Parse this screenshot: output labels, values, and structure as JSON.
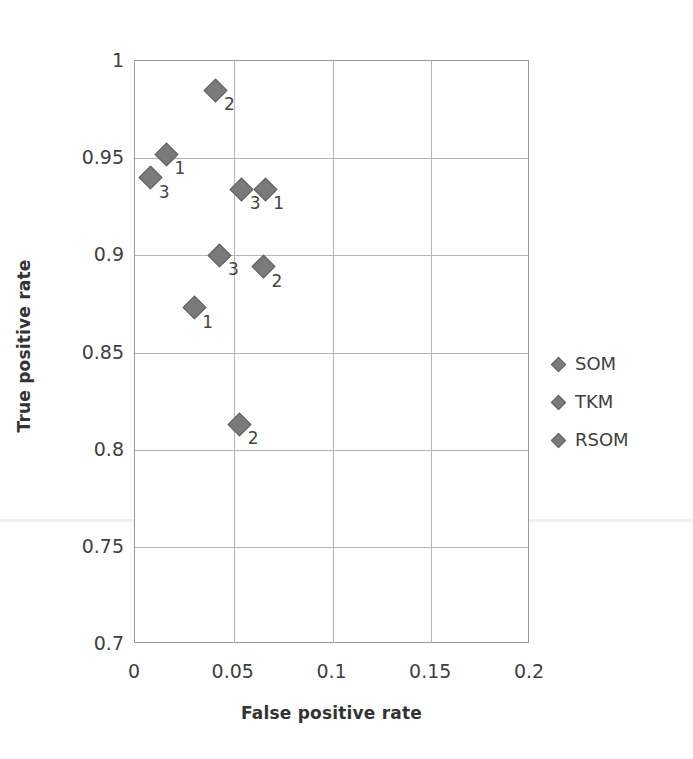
{
  "chart_data": {
    "type": "scatter",
    "title": "",
    "xlabel": "False positive rate",
    "ylabel": "True positive rate",
    "xlim": [
      0,
      0.2
    ],
    "ylim": [
      0.7,
      1
    ],
    "xticks": [
      "0",
      "0.05",
      "0.1",
      "0.15",
      "0.2"
    ],
    "xtick_values": [
      0,
      0.05,
      0.1,
      0.15,
      0.2
    ],
    "yticks": [
      "1",
      "0.95",
      "0.9",
      "0.85",
      "0.8",
      "0.75",
      "0.7"
    ],
    "ytick_values": [
      1,
      0.95,
      0.9,
      0.85,
      0.8,
      0.75,
      0.7
    ],
    "grid": true,
    "legend_position": "right",
    "marker_color": "#7a7a7a",
    "marker_shape": "diamond",
    "series": [
      {
        "name": "SOM",
        "points": [
          {
            "label": "1",
            "x": 0.016,
            "y": 0.952
          },
          {
            "label": "2",
            "x": 0.041,
            "y": 0.985
          },
          {
            "label": "3",
            "x": 0.008,
            "y": 0.94
          }
        ]
      },
      {
        "name": "TKM",
        "points": [
          {
            "label": "1",
            "x": 0.03,
            "y": 0.873
          },
          {
            "label": "2",
            "x": 0.053,
            "y": 0.813
          },
          {
            "label": "3",
            "x": 0.043,
            "y": 0.9
          }
        ]
      },
      {
        "name": "RSOM",
        "points": [
          {
            "label": "1",
            "x": 0.066,
            "y": 0.934
          },
          {
            "label": "2",
            "x": 0.065,
            "y": 0.894
          },
          {
            "label": "3",
            "x": 0.054,
            "y": 0.934
          }
        ]
      }
    ]
  },
  "legend": {
    "items": [
      {
        "label": "SOM"
      },
      {
        "label": "TKM"
      },
      {
        "label": "RSOM"
      }
    ]
  }
}
